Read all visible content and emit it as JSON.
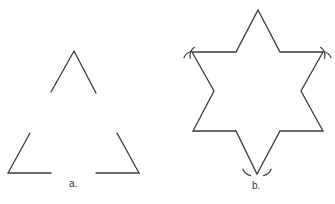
{
  "figure": {
    "panel_a": {
      "label": "a.",
      "description": "Three separated segments of an equilateral triangle (corners with middle thirds removed)",
      "paths": [
        [
          [
            51,
            92
          ],
          [
            74,
            51
          ],
          [
            96,
            93
          ]
        ],
        [
          [
            30,
            133
          ],
          [
            8,
            173
          ],
          [
            51,
            173
          ]
        ],
        [
          [
            117,
            133
          ],
          [
            139,
            173
          ],
          [
            96,
            173
          ]
        ]
      ]
    },
    "panel_b": {
      "label": "b.",
      "description": "Six-pointed star (Koch snowflake first iteration) with compass arc marks at three vertices",
      "outline": [
        [
          258,
          10
        ],
        [
          280,
          52
        ],
        [
          323,
          52
        ],
        [
          301,
          91
        ],
        [
          323,
          131
        ],
        [
          280,
          131
        ],
        [
          257,
          174
        ],
        [
          236,
          131
        ],
        [
          193,
          131
        ],
        [
          214,
          91
        ],
        [
          192,
          52
        ],
        [
          236,
          52
        ]
      ],
      "arc_marks_at": [
        [
          192,
          52
        ],
        [
          323,
          52
        ],
        [
          257,
          174
        ]
      ]
    },
    "stroke_color": "#3a3a3a"
  }
}
